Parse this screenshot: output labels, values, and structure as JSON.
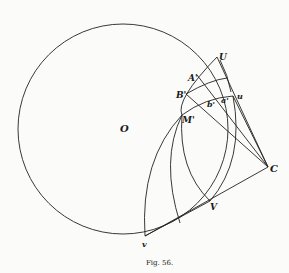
{
  "figure": {
    "caption": "Fig. 56.",
    "labels": {
      "O": "O",
      "U": "U",
      "A": "A'",
      "B": "B'",
      "M": "M'",
      "b": "b'",
      "a": "a'",
      "u": "u",
      "C": "C",
      "V": "V",
      "v": "v"
    }
  }
}
